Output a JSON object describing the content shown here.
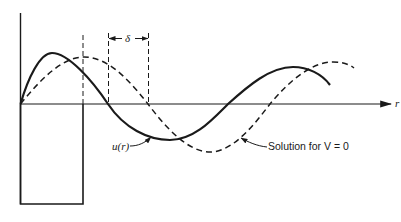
{
  "figure": {
    "axis_label_r": "r",
    "delta_label": "δ",
    "curve_label": "u(r)",
    "reference_label": "Solution for V = 0",
    "line_color": "#1a1a1a",
    "background": "#ffffff"
  },
  "elements": {
    "solid_curve": "u(r) wavefunction with potential well",
    "dashed_curve": "free solution (V = 0)",
    "well": "square potential well below r axis",
    "phase_shift": "δ marked between zero crossings"
  }
}
